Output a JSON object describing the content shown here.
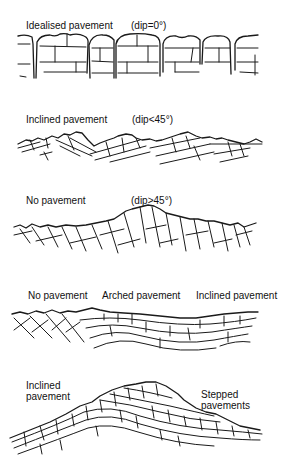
{
  "figure": {
    "type": "limestone pavement morphology vs. bedding dip",
    "panels": [
      {
        "id": "idealised",
        "labels": [
          {
            "text": "Idealised pavement"
          },
          {
            "text": "(dip=0°)"
          }
        ]
      },
      {
        "id": "inclined",
        "labels": [
          {
            "text": "Inclined pavement"
          },
          {
            "text": "(dip<45°)"
          }
        ]
      },
      {
        "id": "no-pavement",
        "labels": [
          {
            "text": "No pavement"
          },
          {
            "text": "(dip>45°)"
          }
        ]
      },
      {
        "id": "folded",
        "labels": [
          {
            "text": "No pavement"
          },
          {
            "text": "Arched pavement"
          },
          {
            "text": "Inclined pavement"
          }
        ]
      },
      {
        "id": "stepped",
        "labels": [
          {
            "text": "Inclined"
          },
          {
            "text": "pavement"
          },
          {
            "text": "Stepped"
          },
          {
            "text": "pavements"
          }
        ]
      }
    ]
  },
  "colors": {
    "ink": "#1a1a1a",
    "background": "#ffffff"
  }
}
